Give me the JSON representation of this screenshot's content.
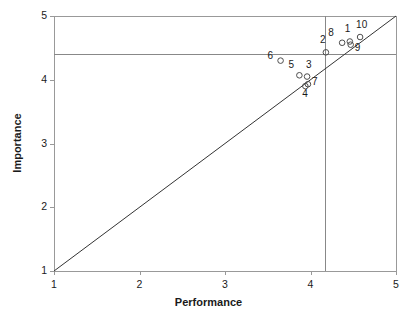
{
  "chart_data": {
    "type": "scatter",
    "title": "",
    "xlabel": "Performance",
    "ylabel": "Importance",
    "xlim": [
      1,
      5
    ],
    "ylim": [
      1,
      5
    ],
    "xticks": [
      1,
      2,
      3,
      4,
      5
    ],
    "yticks": [
      1,
      2,
      3,
      4,
      5
    ],
    "xtick_labels": [
      "1",
      "2",
      "3",
      "4",
      "5"
    ],
    "ytick_labels": [
      "1",
      "2",
      "3",
      "4",
      "5"
    ],
    "grid": false,
    "legend": "none",
    "marker": "open-circle",
    "marker_color": "#4d4d4d",
    "diagonal_line": {
      "from": [
        1,
        1
      ],
      "to": [
        5,
        5
      ],
      "color": "#333333",
      "label": "45-degree iso-rating line"
    },
    "reference_lines": [
      {
        "orientation": "vertical",
        "value": 4.17,
        "color": "#888888",
        "label": "mean performance"
      },
      {
        "orientation": "horizontal",
        "value": 4.4,
        "color": "#888888",
        "label": "mean importance"
      }
    ],
    "points": [
      {
        "id": "1",
        "x": 4.46,
        "y": 4.6,
        "label_dx": -2,
        "label_dy": -13
      },
      {
        "id": "2",
        "x": 4.18,
        "y": 4.43,
        "label_dx": -3,
        "label_dy": -12
      },
      {
        "id": "3",
        "x": 3.96,
        "y": 4.05,
        "label_dx": 2,
        "label_dy": -12
      },
      {
        "id": "4",
        "x": 3.94,
        "y": 3.9,
        "label_dx": 0,
        "label_dy": 8
      },
      {
        "id": "5",
        "x": 3.87,
        "y": 4.07,
        "label_dx": -8,
        "label_dy": -10
      },
      {
        "id": "6",
        "x": 3.65,
        "y": 4.3,
        "label_dx": -10,
        "label_dy": -5
      },
      {
        "id": "7",
        "x": 3.97,
        "y": 3.93,
        "label_dx": 7,
        "label_dy": -2
      },
      {
        "id": "8",
        "x": 4.37,
        "y": 4.58,
        "label_dx": -11,
        "label_dy": -10
      },
      {
        "id": "9",
        "x": 4.47,
        "y": 4.55,
        "label_dx": 7,
        "label_dy": 3
      },
      {
        "id": "10",
        "x": 4.58,
        "y": 4.67,
        "label_dx": -1,
        "label_dy": -12
      }
    ]
  },
  "axes": {
    "x_title": "Performance",
    "y_title": "Importance"
  },
  "colors": {
    "frame": "#999999",
    "text": "#1a1a1a",
    "marker": "#4d4d4d",
    "diagonal": "#333333",
    "reference": "#8c8c8c"
  }
}
